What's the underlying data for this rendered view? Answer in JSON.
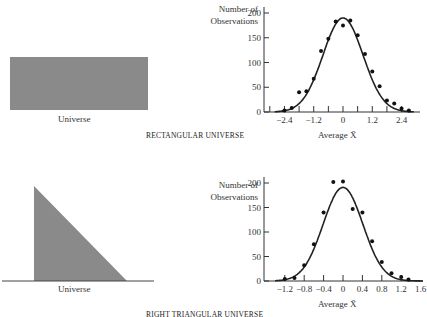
{
  "panels": [
    {
      "universe_shape": "rectangle",
      "universe_label": "Universe",
      "caption": "RECTANGULAR UNIVERSE",
      "fill_color": "#8a8a8a"
    },
    {
      "universe_shape": "right-triangle",
      "universe_label": "Universe",
      "caption": "RIGHT TRIANGULAR UNIVERSE",
      "fill_color": "#8a8a8a"
    }
  ],
  "chart_data": [
    {
      "type": "scatter",
      "title": "RECTANGULAR UNIVERSE",
      "xlabel": "Average X̄",
      "ylabel": "Number of Observations",
      "ylabel_line1": "Number of",
      "ylabel_line2": "Observations",
      "xlim": [
        -2.8,
        2.9
      ],
      "ylim": [
        0,
        200
      ],
      "x_ticks": [
        -2.4,
        -1.2,
        0,
        1.2,
        2.4
      ],
      "x_tick_labels": [
        "−2.4",
        "−1.2",
        "0",
        "1.2",
        "2.4"
      ],
      "y_ticks": [
        0,
        50,
        100,
        150,
        200
      ],
      "grid": false,
      "series": [
        {
          "name": "observed",
          "x": [
            -2.4,
            -2.1,
            -1.8,
            -1.5,
            -1.2,
            -0.9,
            -0.6,
            -0.3,
            0.0,
            0.3,
            0.6,
            0.9,
            1.2,
            1.5,
            1.8,
            2.1,
            2.4,
            2.7
          ],
          "y": [
            3,
            8,
            40,
            42,
            67,
            123,
            148,
            183,
            175,
            185,
            155,
            117,
            82,
            52,
            23,
            17,
            7,
            3
          ]
        },
        {
          "name": "normal curve",
          "type": "line",
          "mean": 0,
          "sd": 0.82,
          "peak": 190
        }
      ]
    },
    {
      "type": "scatter",
      "title": "RIGHT TRIANGULAR UNIVERSE",
      "xlabel": "Average X̄",
      "ylabel": "Number of Observations",
      "ylabel_line1": "Number of",
      "ylabel_line2": "Observations",
      "xlim": [
        -1.4,
        1.65
      ],
      "ylim": [
        0,
        200
      ],
      "x_ticks": [
        -1.2,
        -0.8,
        -0.4,
        0,
        0.4,
        0.8,
        1.2,
        1.6
      ],
      "x_tick_labels": [
        "−1.2",
        "−0.8",
        "−0.4",
        "0",
        "0.4",
        "0.8",
        "1.2",
        "1.6"
      ],
      "y_ticks": [
        0,
        50,
        100,
        150,
        200
      ],
      "grid": false,
      "series": [
        {
          "name": "observed",
          "x": [
            -1.2,
            -1.0,
            -0.8,
            -0.6,
            -0.4,
            -0.2,
            0.0,
            0.2,
            0.4,
            0.6,
            0.8,
            1.0,
            1.2,
            1.35
          ],
          "y": [
            4,
            6,
            32,
            75,
            140,
            202,
            203,
            147,
            140,
            81,
            39,
            16,
            8,
            3
          ]
        },
        {
          "name": "normal curve",
          "type": "line",
          "mean": 0,
          "sd": 0.41,
          "peak": 191
        }
      ]
    }
  ]
}
